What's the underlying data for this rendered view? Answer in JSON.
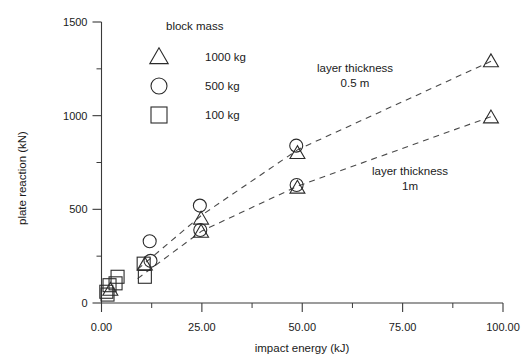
{
  "chart_data": {
    "type": "scatter",
    "title": "",
    "xlabel": "impact energy (kJ)",
    "ylabel": "plate reaction (kN)",
    "xlim": [
      0,
      100
    ],
    "ylim": [
      0,
      1500
    ],
    "xticks": [
      "0.00",
      "25.00",
      "50.00",
      "75.00",
      "100.00"
    ],
    "xtick_values": [
      0,
      25,
      50,
      75,
      100
    ],
    "xminor_values": [
      12.5,
      37.5,
      62.5,
      87.5
    ],
    "yticks": [
      "0",
      "500",
      "1000",
      "1500"
    ],
    "ytick_values": [
      0,
      500,
      1000,
      1500
    ],
    "yminor_values": [
      250,
      750,
      1250
    ],
    "grid": false,
    "legend": {
      "title": "block mass",
      "position": "upper-left-inside",
      "entries": [
        {
          "marker": "triangle",
          "label": "1000 kg"
        },
        {
          "marker": "circle",
          "label": "500 kg"
        },
        {
          "marker": "square",
          "label": "100 kg"
        }
      ]
    },
    "annotations": [
      {
        "id": "upper-curve-label",
        "line1": "layer thickness",
        "line2": "0.5 m"
      },
      {
        "id": "lower-curve-label",
        "line1": "layer thickness",
        "line2": "1m"
      }
    ],
    "series": [
      {
        "name": "layer thickness 0.5 m",
        "trend": "dashed",
        "points": [
          {
            "x": 1.2,
            "y": 60,
            "marker": "square"
          },
          {
            "x": 2.0,
            "y": 95,
            "marker": "square"
          },
          {
            "x": 2.2,
            "y": 70,
            "marker": "triangle"
          },
          {
            "x": 4.0,
            "y": 140,
            "marker": "square"
          },
          {
            "x": 10.5,
            "y": 210,
            "marker": "square"
          },
          {
            "x": 10.8,
            "y": 205,
            "marker": "triangle"
          },
          {
            "x": 12.0,
            "y": 330,
            "marker": "circle"
          },
          {
            "x": 12.2,
            "y": 225,
            "marker": "circle"
          },
          {
            "x": 24.5,
            "y": 520,
            "marker": "circle"
          },
          {
            "x": 24.8,
            "y": 450,
            "marker": "triangle"
          },
          {
            "x": 48.5,
            "y": 840,
            "marker": "circle"
          },
          {
            "x": 48.8,
            "y": 800,
            "marker": "triangle"
          },
          {
            "x": 97.0,
            "y": 1290,
            "marker": "triangle"
          }
        ]
      },
      {
        "name": "layer thickness 1m",
        "trend": "dashed",
        "points": [
          {
            "x": 1.5,
            "y": 45,
            "marker": "square"
          },
          {
            "x": 3.5,
            "y": 105,
            "marker": "square"
          },
          {
            "x": 10.8,
            "y": 140,
            "marker": "square"
          },
          {
            "x": 24.6,
            "y": 390,
            "marker": "circle"
          },
          {
            "x": 24.8,
            "y": 380,
            "marker": "triangle"
          },
          {
            "x": 48.6,
            "y": 630,
            "marker": "circle"
          },
          {
            "x": 48.8,
            "y": 615,
            "marker": "triangle"
          },
          {
            "x": 97.0,
            "y": 990,
            "marker": "triangle"
          }
        ]
      }
    ],
    "trendlines": [
      {
        "name": "layer thickness 0.5 m",
        "path": [
          [
            9,
            180
          ],
          [
            25,
            470
          ],
          [
            49,
            820
          ],
          [
            97,
            1290
          ]
        ]
      },
      {
        "name": "layer thickness 1m",
        "path": [
          [
            9,
            130
          ],
          [
            25,
            385
          ],
          [
            49,
            625
          ],
          [
            97,
            995
          ]
        ]
      }
    ]
  }
}
